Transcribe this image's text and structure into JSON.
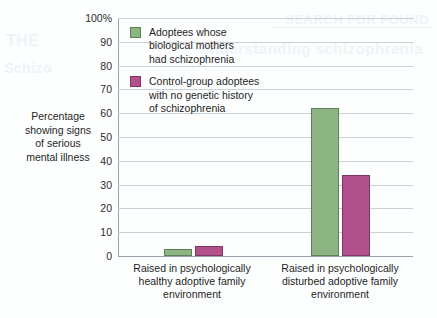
{
  "chart_data": {
    "type": "bar",
    "title": "",
    "xlabel": "",
    "ylabel": "Percentage\nshowing signs\nof serious\nmental illness",
    "ylim": [
      0,
      100
    ],
    "yticks": [
      "0",
      "10",
      "20",
      "30",
      "40",
      "50",
      "60",
      "70",
      "80",
      "90",
      "100%"
    ],
    "ytick_values": [
      0,
      10,
      20,
      30,
      40,
      50,
      60,
      70,
      80,
      90,
      100
    ],
    "grid": true,
    "legend_position": "upper-left-inside",
    "categories": [
      "Raised in psychologically\nhealthy adoptive family\nenvironment",
      "Raised in psychologically\ndisturbed adoptive family\nenvironment"
    ],
    "series": [
      {
        "name": "Adoptees whose\nbiological mothers\nhad schizophrenia",
        "color": "#8cb583",
        "border_color": "#5d7f59",
        "values": [
          3,
          62
        ]
      },
      {
        "name": "Control-group adoptees\nwith no genetic history\nof schizophrenia",
        "color": "#b2508c",
        "border_color": "#7d3762",
        "values": [
          4,
          34
        ]
      }
    ]
  },
  "colors": {
    "background": "#fdfefe",
    "gridline": "#c9d0d6",
    "axis": "#9aa3ab",
    "text": "#1f1f1f"
  },
  "bleed_through": {
    "line_a": "SEARCH FOR FOUND",
    "line_b": "understanding schizophrenia",
    "line_c": "THE",
    "line_d": "Schizo"
  }
}
